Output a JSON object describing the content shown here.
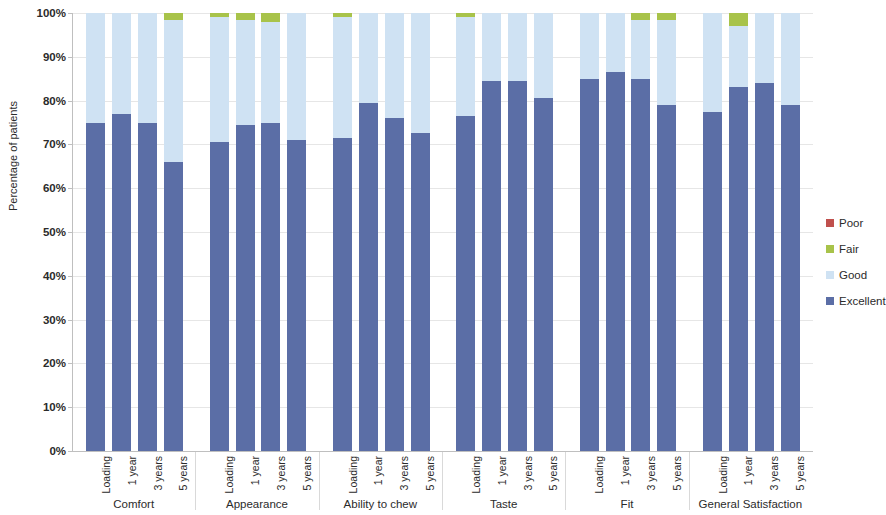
{
  "chart_data": {
    "type": "bar",
    "subtype": "stacked-bar-100-percent",
    "title": "",
    "xlabel": "",
    "ylabel": "Percentage of patients",
    "ylim": [
      0,
      100
    ],
    "ytick_labels": [
      "0%",
      "10%",
      "20%",
      "30%",
      "40%",
      "50%",
      "60%",
      "70%",
      "80%",
      "90%",
      "100%"
    ],
    "ytick_values": [
      0,
      10,
      20,
      30,
      40,
      50,
      60,
      70,
      80,
      90,
      100
    ],
    "grid": true,
    "legend_position": "right",
    "categories": [
      "Comfort",
      "Appearance",
      "Ability to chew",
      "Taste",
      "Fit",
      "General Satisfaction"
    ],
    "subcategories": [
      "Loading",
      "1 year",
      "3 years",
      "5 years"
    ],
    "series": [
      {
        "name": "Excellent",
        "color": "#5b6ea6",
        "values": [
          [
            75.0,
            77.0,
            75.0,
            66.0
          ],
          [
            70.5,
            74.5,
            75.0,
            71.0
          ],
          [
            71.5,
            79.5,
            76.0,
            72.5
          ],
          [
            76.5,
            84.5,
            84.5,
            80.5
          ],
          [
            85.0,
            86.5,
            85.0,
            79.0
          ],
          [
            77.5,
            83.0,
            84.0,
            79.0
          ]
        ]
      },
      {
        "name": "Good",
        "color": "#cfe2f3",
        "values": [
          [
            25.0,
            23.0,
            25.0,
            32.5
          ],
          [
            28.5,
            24.0,
            23.0,
            29.0
          ],
          [
            27.5,
            20.5,
            24.0,
            27.5
          ],
          [
            22.5,
            15.5,
            15.5,
            19.5
          ],
          [
            15.0,
            13.5,
            13.5,
            19.5
          ],
          [
            22.5,
            14.0,
            16.0,
            21.0
          ]
        ]
      },
      {
        "name": "Fair",
        "color": "#a8c34a",
        "values": [
          [
            0.0,
            0.0,
            0.0,
            1.5
          ],
          [
            1.0,
            1.5,
            2.0,
            0.0
          ],
          [
            1.0,
            0.0,
            0.0,
            0.0
          ],
          [
            1.0,
            0.0,
            0.0,
            0.0
          ],
          [
            0.0,
            0.0,
            1.5,
            1.5
          ],
          [
            0.0,
            3.0,
            0.0,
            0.0
          ]
        ]
      },
      {
        "name": "Poor",
        "color": "#c0504d",
        "values": [
          [
            0.0,
            0.0,
            0.0,
            0.0
          ],
          [
            0.0,
            0.0,
            0.0,
            0.0
          ],
          [
            0.0,
            0.0,
            0.0,
            0.0
          ],
          [
            0.0,
            0.0,
            0.0,
            0.0
          ],
          [
            0.0,
            0.0,
            0.0,
            0.0
          ],
          [
            0.0,
            0.0,
            0.0,
            0.0
          ]
        ]
      }
    ]
  },
  "legend": {
    "items": [
      {
        "label": "Poor",
        "color": "#c0504d"
      },
      {
        "label": "Fair",
        "color": "#a8c34a"
      },
      {
        "label": "Good",
        "color": "#cfe2f3"
      },
      {
        "label": "Excellent",
        "color": "#5b6ea6"
      }
    ]
  }
}
